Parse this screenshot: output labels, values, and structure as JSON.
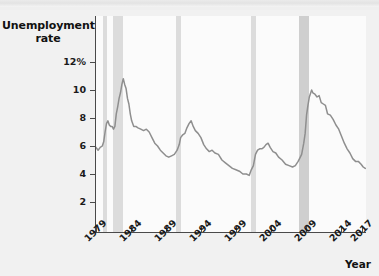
{
  "chart_data": {
    "type": "line",
    "ylabel": "Unemployment rate",
    "xlabel": "Year",
    "ylim": [
      0,
      12.8
    ],
    "xlim": [
      1979,
      2017.6
    ],
    "grid": false,
    "legend": null,
    "y_ticks": [
      "12%",
      "10",
      "8",
      "6",
      "4",
      "2"
    ],
    "y_tick_values": [
      12,
      10,
      8,
      6,
      4,
      2
    ],
    "x_ticks": [
      "1979",
      "1984",
      "1989",
      "1994",
      "1999",
      "2004",
      "2009",
      "2014",
      "2017"
    ],
    "x_tick_values": [
      1979,
      1984,
      1989,
      1994,
      1999,
      2004,
      2009,
      2014,
      2017
    ],
    "series": [
      {
        "name": "Unemployment rate",
        "color": "#8e8e8e",
        "x": [
          1979.0,
          1979.3,
          1979.6,
          1979.9,
          1980.1,
          1980.3,
          1980.5,
          1980.7,
          1980.9,
          1981.1,
          1981.3,
          1981.5,
          1981.7,
          1981.9,
          1982.1,
          1982.3,
          1982.5,
          1982.7,
          1982.9,
          1983.1,
          1983.3,
          1983.5,
          1983.7,
          1983.9,
          1984.1,
          1984.4,
          1984.7,
          1985.0,
          1985.4,
          1985.8,
          1986.2,
          1986.6,
          1987.0,
          1987.4,
          1987.8,
          1988.2,
          1988.6,
          1989.0,
          1989.4,
          1989.8,
          1990.2,
          1990.6,
          1990.9,
          1991.1,
          1991.4,
          1991.7,
          1992.0,
          1992.3,
          1992.6,
          1992.9,
          1993.2,
          1993.6,
          1994.0,
          1994.4,
          1994.8,
          1995.2,
          1995.6,
          1996.0,
          1996.5,
          1997.0,
          1997.5,
          1998.0,
          1998.5,
          1999.0,
          1999.5,
          2000.0,
          2000.5,
          2000.9,
          2001.2,
          2001.5,
          2001.8,
          2002.1,
          2002.4,
          2002.7,
          2003.0,
          2003.3,
          2003.6,
          2003.9,
          2004.3,
          2004.7,
          2005.1,
          2005.6,
          2006.1,
          2006.6,
          2007.1,
          2007.5,
          2007.9,
          2008.1,
          2008.4,
          2008.7,
          2008.9,
          2009.1,
          2009.3,
          2009.5,
          2009.7,
          2009.83,
          2010.0,
          2010.3,
          2010.6,
          2010.9,
          2011.2,
          2011.5,
          2011.8,
          2012.1,
          2012.5,
          2012.9,
          2013.3,
          2013.7,
          2014.1,
          2014.5,
          2014.9,
          2015.3,
          2015.7,
          2016.1,
          2016.5,
          2016.9,
          2017.2,
          2017.5
        ],
        "y": [
          5.9,
          5.7,
          5.9,
          6.0,
          6.3,
          7.0,
          7.6,
          7.8,
          7.5,
          7.4,
          7.4,
          7.2,
          7.4,
          8.3,
          8.8,
          9.4,
          9.8,
          10.4,
          10.8,
          10.4,
          10.1,
          9.4,
          9.0,
          8.3,
          7.8,
          7.4,
          7.4,
          7.3,
          7.2,
          7.1,
          7.2,
          7.0,
          6.6,
          6.2,
          6.0,
          5.7,
          5.5,
          5.3,
          5.2,
          5.3,
          5.4,
          5.7,
          6.1,
          6.6,
          6.8,
          6.9,
          7.3,
          7.6,
          7.8,
          7.4,
          7.1,
          6.9,
          6.6,
          6.1,
          5.8,
          5.6,
          5.7,
          5.5,
          5.4,
          5.0,
          4.8,
          4.6,
          4.4,
          4.3,
          4.2,
          4.0,
          4.0,
          3.9,
          4.3,
          4.6,
          5.4,
          5.7,
          5.8,
          5.8,
          5.9,
          6.1,
          6.2,
          5.9,
          5.6,
          5.5,
          5.2,
          5.0,
          4.7,
          4.6,
          4.5,
          4.6,
          4.9,
          5.1,
          5.4,
          6.2,
          6.9,
          8.2,
          8.9,
          9.5,
          9.8,
          10.0,
          9.8,
          9.7,
          9.5,
          9.6,
          9.1,
          9.0,
          8.9,
          8.3,
          8.2,
          7.9,
          7.5,
          7.2,
          6.7,
          6.2,
          5.8,
          5.5,
          5.1,
          4.9,
          4.9,
          4.7,
          4.5,
          4.4
        ]
      }
    ],
    "shaded_regions": [
      {
        "label": "recession 1980",
        "start": 1980.0,
        "end": 1980.55,
        "color": "#dcdcdc"
      },
      {
        "label": "recession 1981-82",
        "start": 1981.5,
        "end": 1982.85,
        "color": "#dcdcdc"
      },
      {
        "label": "recession 1990-91",
        "start": 1990.5,
        "end": 1991.2,
        "color": "#dcdcdc"
      },
      {
        "label": "recession 2001",
        "start": 2001.2,
        "end": 2001.9,
        "color": "#dcdcdc"
      },
      {
        "label": "recession 2008-09",
        "start": 2007.95,
        "end": 2009.5,
        "color": "#cfcfcf"
      }
    ]
  }
}
